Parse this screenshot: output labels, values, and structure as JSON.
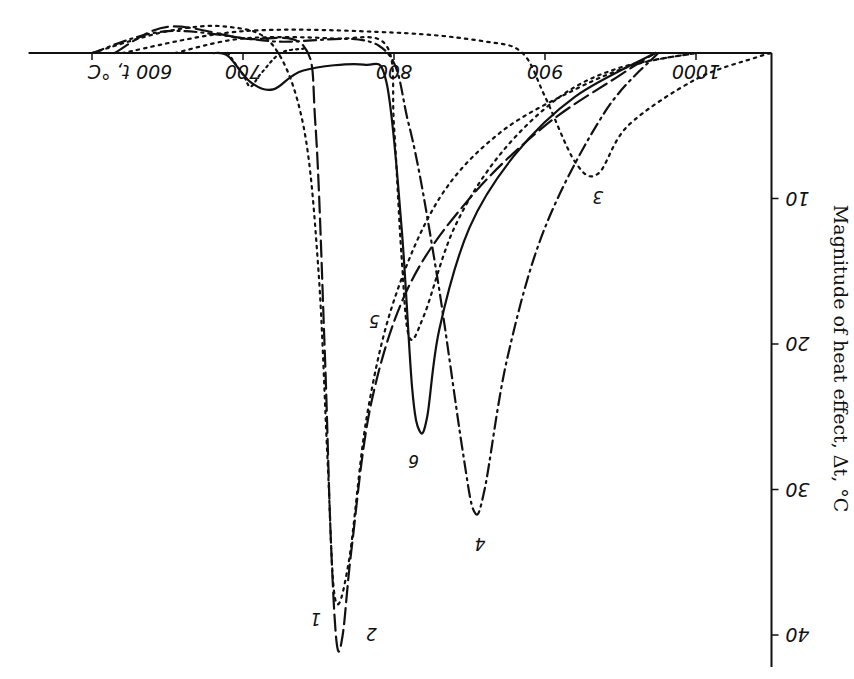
{
  "chart_data": {
    "type": "line",
    "title": "",
    "orientation_note": "scan is rotated 180 degrees",
    "xlabel": "t, °C",
    "ylabel": "Magnitude of heat effect, Δt, °C",
    "x_ticks": [
      600,
      700,
      800,
      900,
      1000
    ],
    "x_tick_labels": [
      "600 t, °C",
      "700",
      "800",
      "900",
      "1000"
    ],
    "y_ticks": [
      10,
      20,
      30,
      40
    ],
    "y_tick_labels": [
      "10",
      "20",
      "30",
      "40"
    ],
    "xlim": [
      600,
      1050
    ],
    "ylim": [
      0,
      42
    ],
    "y_inverted": true,
    "grid": false,
    "legend": "inline curve numbers",
    "series": [
      {
        "name": "1",
        "style": "dotted",
        "x": [
          600,
          650,
          690,
          720,
          740,
          750,
          756,
          761,
          770,
          782,
          800,
          830,
          870,
          920,
          960,
          1000
        ],
        "values": [
          0,
          -1.5,
          -1.8,
          -0.5,
          5,
          15,
          28,
          37.5,
          35,
          25,
          17,
          10,
          5.5,
          2.5,
          0.8,
          0
        ]
      },
      {
        "name": "2",
        "style": "long-dash",
        "x": [
          615,
          650,
          700,
          740,
          748,
          754,
          758,
          762,
          766,
          772,
          785,
          810,
          850,
          900,
          950,
          973
        ],
        "values": [
          0,
          -1.8,
          -1,
          -0.5,
          5,
          20,
          33,
          40.5,
          40,
          34,
          24,
          16,
          10,
          5,
          1.5,
          0
        ]
      },
      {
        "name": "3",
        "style": "dotted",
        "x": [
          620,
          700,
          800,
          860,
          885,
          900,
          920,
          935,
          955,
          1000,
          1040,
          1050
        ],
        "values": [
          0,
          -1.5,
          -1.4,
          -0.8,
          0,
          3,
          7.5,
          8.3,
          5,
          1.8,
          0.3,
          0
        ]
      },
      {
        "name": "4",
        "style": "dash-dot",
        "x": [
          600,
          650,
          720,
          790,
          810,
          828,
          845,
          853,
          860,
          875,
          900,
          940,
          975
        ],
        "values": [
          0,
          -1.5,
          -0.8,
          -0.5,
          5,
          15,
          27,
          31.5,
          30,
          21,
          12,
          4,
          0
        ]
      },
      {
        "name": "5",
        "style": "dotted",
        "x": [
          655,
          700,
          760,
          795,
          800,
          805,
          810,
          820,
          840,
          870,
          910,
          950,
          1000
        ],
        "values": [
          0,
          -1,
          -1,
          -0.5,
          5,
          14,
          19.5,
          18,
          12,
          7,
          3,
          1,
          0
        ]
      },
      {
        "name": "6",
        "style": "solid",
        "x": [
          680,
          690,
          705,
          720,
          740,
          780,
          795,
          805,
          812,
          817,
          822,
          830,
          850,
          880,
          920,
          973
        ],
        "values": [
          0,
          0.2,
          2,
          2.5,
          1.2,
          0.8,
          2,
          12,
          23,
          26,
          25,
          19,
          12,
          7,
          3,
          0
        ]
      },
      {
        "name": "6-knee-shoulder",
        "style": "dotted-small",
        "x": [
          690,
          700,
          705,
          712,
          725,
          740
        ],
        "values": [
          0,
          1.5,
          2.3,
          1.4,
          0,
          -0.3
        ]
      }
    ],
    "label_positions": {
      "1": [
        748,
        38.5
      ],
      "2": [
        785,
        39.5
      ],
      "3": [
        935,
        9.5
      ],
      "4": [
        857,
        33.3
      ],
      "5": [
        787,
        18
      ],
      "6": [
        813,
        27.6
      ]
    }
  }
}
